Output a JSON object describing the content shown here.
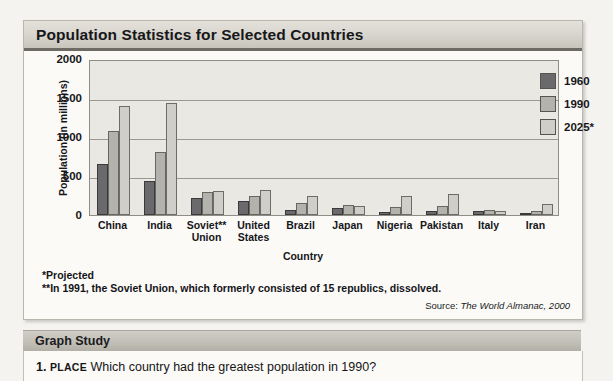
{
  "figure": {
    "title": "Population Statistics for Selected Countries",
    "footnotes": [
      "*Projected",
      "**In 1991, the Soviet Union, which formerly consisted of 15 republics, dissolved."
    ],
    "source_prefix": "Source:",
    "source_text": "The World Almanac, 2000"
  },
  "chart_data": {
    "type": "bar",
    "title": "Population Statistics for Selected Countries",
    "xlabel": "Country",
    "ylabel": "Population (in millions)",
    "ylim": [
      0,
      2000
    ],
    "yticks": [
      0,
      500,
      1000,
      1500,
      2000
    ],
    "grid": true,
    "legend_position": "top-right",
    "categories": [
      "China",
      "India",
      "Soviet**\nUnion",
      "United\nStates",
      "Brazil",
      "Japan",
      "Nigeria",
      "Pakistan",
      "Italy",
      "Iran"
    ],
    "category_labels": [
      [
        "China"
      ],
      [
        "India"
      ],
      [
        "Soviet**",
        "Union"
      ],
      [
        "United",
        "States"
      ],
      [
        "Brazil"
      ],
      [
        "Japan"
      ],
      [
        "Nigeria"
      ],
      [
        "Pakistan"
      ],
      [
        "Italy"
      ],
      [
        "Iran"
      ]
    ],
    "series": [
      {
        "name": "1960",
        "color": "#6a6a6d",
        "values": [
          650,
          435,
          215,
          180,
          70,
          95,
          40,
          50,
          50,
          20
        ]
      },
      {
        "name": "1990",
        "color": "#b3b2ad",
        "values": [
          1075,
          810,
          290,
          250,
          150,
          125,
          105,
          115,
          58,
          55
        ]
      },
      {
        "name": "2025*",
        "color": "#cfcec8",
        "values": [
          1400,
          1430,
          305,
          325,
          245,
          120,
          240,
          270,
          50,
          145
        ]
      }
    ]
  },
  "study": {
    "header": "Graph Study",
    "questions": [
      {
        "number": "1.",
        "theme": "PLACE",
        "text": "Which country had the greatest population in 1990?"
      }
    ]
  }
}
